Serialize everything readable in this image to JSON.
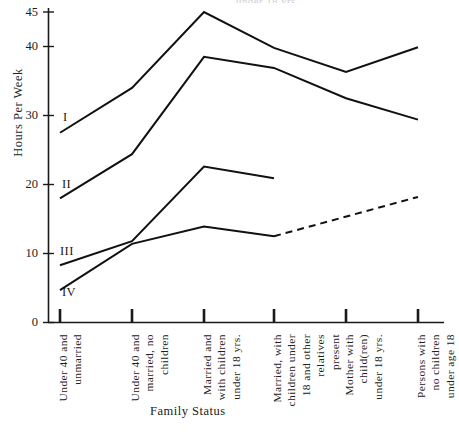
{
  "chart_data": {
    "type": "line",
    "title": "",
    "xlabel": "Family Status",
    "ylabel": "Hours Per Week",
    "ylim": [
      0,
      45
    ],
    "yticks": [
      0,
      10,
      20,
      30,
      40,
      45
    ],
    "ytick_labels": [
      "0",
      "10",
      "20",
      "30",
      "40",
      "45"
    ],
    "grid": false,
    "legend": "inline-left",
    "categories": [
      "Under 40 and unmarried",
      "Under 40 and married, no children",
      "Married and with children under 18 yrs.",
      "Married, with children under 18 and other relatives present",
      "Mother with child(ren) under 18 yrs.",
      "Persons with no children under age 18"
    ],
    "category_lines": [
      [
        "Under 40 and",
        "unmarried"
      ],
      [
        "Under 40 and",
        "married, no",
        "children"
      ],
      [
        "Married and",
        "with children",
        "under 18 yrs."
      ],
      [
        "Married, with",
        "children under",
        "18 and other",
        "relatives",
        "present"
      ],
      [
        "Mother with",
        "child(ren)",
        "under 18 yrs."
      ],
      [
        "Persons with",
        "no children",
        "under age 18"
      ]
    ],
    "series": [
      {
        "name": "I",
        "label": "I",
        "style": "solid",
        "values": [
          27.5,
          34.0,
          45.0,
          39.8,
          36.3,
          39.9
        ]
      },
      {
        "name": "II",
        "label": "II",
        "style": "solid",
        "values": [
          18.0,
          24.4,
          38.5,
          36.9,
          32.5,
          29.4
        ]
      },
      {
        "name": "III",
        "label": "III",
        "style": "solid",
        "values": [
          8.3,
          11.8,
          22.6,
          20.9,
          null,
          null
        ]
      },
      {
        "name": "IV",
        "label": "IV",
        "style": "solid-then-dashed",
        "dash_from_index": 3,
        "values": [
          4.7,
          11.4,
          13.9,
          12.5,
          null,
          18.2
        ]
      }
    ],
    "series_label_positions": [
      {
        "label": "I",
        "x": 63,
        "y": 110
      },
      {
        "label": "II",
        "x": 62,
        "y": 177
      },
      {
        "label": "III",
        "x": 60,
        "y": 244
      },
      {
        "label": "IV",
        "x": 62,
        "y": 285
      }
    ],
    "annotations": {
      "top_cut_fragment": "under 18 yrs."
    },
    "colors": {
      "line": "#111111",
      "axis": "#1a1a1a",
      "background": "#ffffff",
      "text": "#1b1b1b"
    }
  }
}
